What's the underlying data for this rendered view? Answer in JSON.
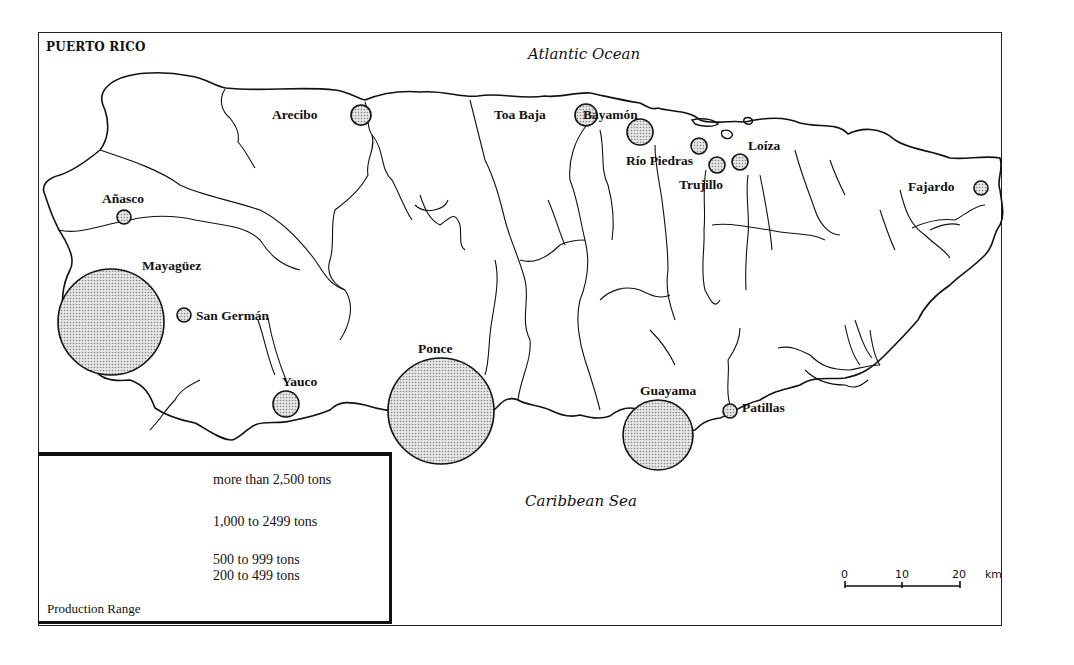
{
  "map": {
    "title": "PUERTO RICO",
    "north_water": "Atlantic Ocean",
    "south_water": "Caribbean Sea",
    "fill_color": "#c8c8c8",
    "outline_color": "#111111"
  },
  "cities": [
    {
      "name": "Arecibo",
      "cx": 361,
      "cy": 115,
      "r": 10,
      "label_x": 272,
      "label_y": 115
    },
    {
      "name": "Toa Baja",
      "cx": 586,
      "cy": 115,
      "r": 11,
      "label_x": 494,
      "label_y": 115
    },
    {
      "name": "Bayamón",
      "cx": 640,
      "cy": 132,
      "r": 13,
      "label_x": 583,
      "label_y": 115
    },
    {
      "name": "Río Piedras",
      "cx": 699,
      "cy": 146,
      "r": 8,
      "label_x": 626,
      "label_y": 161
    },
    {
      "name": "Trujillo",
      "cx": 717,
      "cy": 165,
      "r": 8,
      "label_x": 679,
      "label_y": 185
    },
    {
      "name": "Loíza",
      "cx": 740,
      "cy": 162,
      "r": 8,
      "label_x": 748,
      "label_y": 146
    },
    {
      "name": "Fajardo",
      "cx": 981,
      "cy": 188,
      "r": 7,
      "label_x": 908,
      "label_y": 187
    },
    {
      "name": "Añasco",
      "cx": 124,
      "cy": 217,
      "r": 7,
      "label_x": 102,
      "label_y": 199
    },
    {
      "name": "Mayagüez",
      "cx": 111,
      "cy": 322,
      "r": 53,
      "label_x": 142,
      "label_y": 266
    },
    {
      "name": "San Germán",
      "cx": 184,
      "cy": 315,
      "r": 7,
      "label_x": 196,
      "label_y": 316
    },
    {
      "name": "Yauco",
      "cx": 286,
      "cy": 404,
      "r": 13,
      "label_x": 282,
      "label_y": 382
    },
    {
      "name": "Ponce",
      "cx": 441,
      "cy": 411,
      "r": 53,
      "label_x": 418,
      "label_y": 349
    },
    {
      "name": "Guayama",
      "cx": 658,
      "cy": 435,
      "r": 35,
      "label_x": 640,
      "label_y": 391
    },
    {
      "name": "Patillas",
      "cx": 730,
      "cy": 411,
      "r": 7,
      "label_x": 742,
      "label_y": 408
    }
  ],
  "legend": {
    "title": "Production Range",
    "ranges": [
      {
        "label": "more than 2,500 tons",
        "r": 53
      },
      {
        "label": "1,000 to 2499 tons",
        "r": 34
      },
      {
        "label": "500 to 999 tons",
        "r": 13
      },
      {
        "label": "200 to 499 tons",
        "r": 8
      }
    ]
  },
  "scale": {
    "ticks": [
      "0",
      "10",
      "20"
    ],
    "unit": "km"
  }
}
